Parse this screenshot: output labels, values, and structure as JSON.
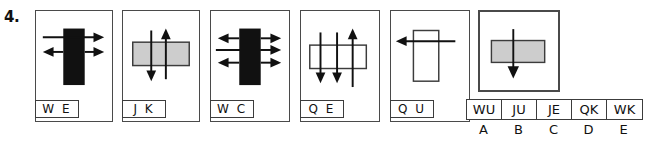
{
  "question": {
    "number": "4."
  },
  "panels": [
    {
      "id": "panel-1",
      "tag": "W E",
      "shape": "black-vertical-rectangle",
      "arrows": "line-in-left-arrow-right-top; arrow-left-and-arrow-right-bottom"
    },
    {
      "id": "panel-2",
      "tag": "J K",
      "shape": "gray-horizontal-rectangle",
      "arrows": "arrow-down-left; arrow-up-right"
    },
    {
      "id": "panel-3",
      "tag": "W C",
      "shape": "black-vertical-rectangle",
      "arrows": "arrow-left-and-right-top; line-in-left-arrow-right-middle; arrow-left-and-right-bottom"
    },
    {
      "id": "panel-4",
      "tag": "Q E",
      "shape": "white-horizontal-rectangle",
      "arrows": "two-arrows-down; one-arrow-up-right"
    },
    {
      "id": "panel-5",
      "tag": "Q U",
      "shape": "white-vertical-rectangle",
      "arrows": "arrow-left-through"
    },
    {
      "id": "panel-6",
      "tag": "",
      "shape": "gray-horizontal-rectangle",
      "arrows": "arrow-down-through"
    }
  ],
  "answers": {
    "options": [
      "WU",
      "JU",
      "JE",
      "QK",
      "WK"
    ],
    "letters": [
      "A",
      "B",
      "C",
      "D",
      "E"
    ]
  },
  "colors": {
    "black_fill": "#111111",
    "gray_fill": "#cdcdcd",
    "stroke": "#3c3c3c",
    "panel_border": "#4a4a4a"
  }
}
